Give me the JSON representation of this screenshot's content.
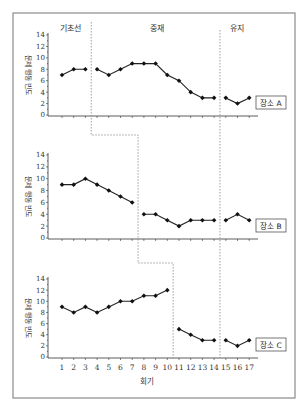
{
  "chart_data": {
    "type": "line",
    "title": "",
    "design": "multiple-baseline across settings",
    "xlabel": "회기",
    "ylabel": "문제 행동 빈도",
    "x": [
      1,
      2,
      3,
      4,
      5,
      6,
      7,
      8,
      9,
      10,
      11,
      12,
      13,
      14,
      15,
      16,
      17
    ],
    "ylim": [
      0,
      14
    ],
    "yticks": [
      0,
      2,
      4,
      6,
      8,
      10,
      12,
      14
    ],
    "grid": false,
    "phases": [
      {
        "name": "기초선"
      },
      {
        "name": "중재"
      },
      {
        "name": "유지"
      }
    ],
    "panels": [
      {
        "name": "장소 A",
        "baseline_end": 3,
        "maintenance_start": 15,
        "values": [
          7,
          8,
          8,
          8,
          7,
          8,
          9,
          9,
          9,
          7,
          6,
          4,
          3,
          3,
          3,
          2,
          3
        ]
      },
      {
        "name": "장소 B",
        "baseline_end": 7,
        "maintenance_start": 15,
        "values": [
          9,
          9,
          10,
          9,
          8,
          7,
          6,
          4,
          4,
          3,
          2,
          3,
          3,
          3,
          3,
          4,
          3
        ]
      },
      {
        "name": "장소 C",
        "baseline_end": 10,
        "maintenance_start": 15,
        "values": [
          9,
          8,
          9,
          8,
          9,
          10,
          10,
          11,
          11,
          12,
          5,
          4,
          3,
          3,
          3,
          2,
          3
        ]
      }
    ]
  },
  "labels": {
    "phase_baseline": "기초선",
    "phase_intervention": "중재",
    "phase_maintenance": "유지",
    "ylabel": "문제 행동 빈도",
    "xlabel": "회기",
    "site_a": "장소 A",
    "site_b": "장소 B",
    "site_c": "장소 C"
  }
}
